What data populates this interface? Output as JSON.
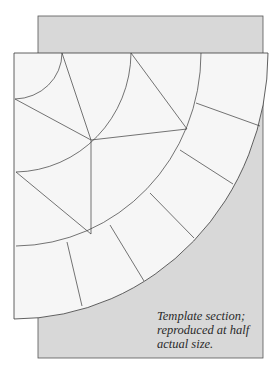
{
  "figure": {
    "type": "quilt-template-diagram",
    "colors": {
      "background_panel": "#d9d9d9",
      "template": "#f6f6f6",
      "line": "#3a3a3a",
      "page": "#ffffff"
    },
    "caption": {
      "lines": [
        "Template section;",
        "reproduced at half",
        "actual size."
      ]
    }
  }
}
